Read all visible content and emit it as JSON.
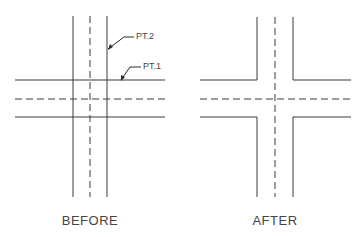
{
  "diagram": {
    "before": {
      "caption": "BEFORE",
      "callouts": [
        {
          "id": "pt2",
          "text": "PT.2"
        },
        {
          "id": "pt1",
          "text": "PT.1"
        }
      ]
    },
    "after": {
      "caption": "AFTER"
    },
    "colors": {
      "line": "#3a3a3a",
      "text": "#444444",
      "background": "#ffffff"
    }
  }
}
